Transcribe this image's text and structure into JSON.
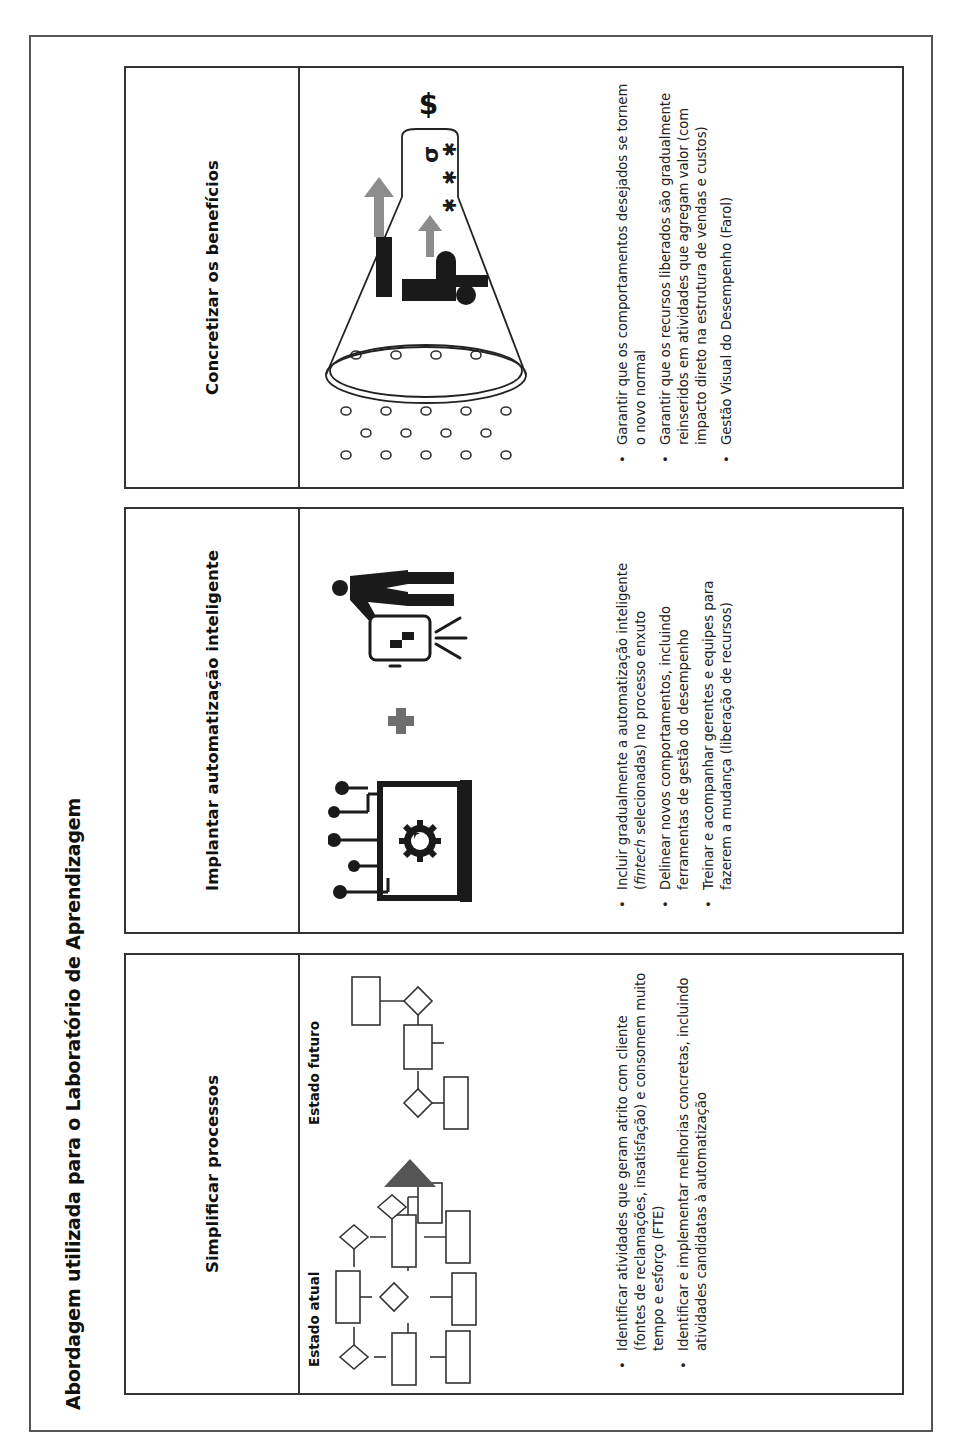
{
  "title": "Abordagem utilizada para o Laboratório de Aprendizagem",
  "panels": [
    {
      "heading": "Simplificar processos",
      "illustration": {
        "current_label": "Estado atual",
        "future_label": "Estado futuro",
        "icons": [
          "flowchart-current-icon",
          "arrow-right-triangle-icon",
          "flowchart-future-icon"
        ]
      },
      "bullets": [
        {
          "text": "Identificar atividades que geram atrito com cliente (fontes de reclamações, insatisfação) e consomem muito tempo e esforço (FTE)"
        },
        {
          "text": "Identificar e implementar melhorias concretas, incluindo atividades candidatas à automatização"
        }
      ]
    },
    {
      "heading": "Implantar automatização inteligente",
      "illustration": {
        "icons": [
          "automation-gear-monitor-icon",
          "plus-icon",
          "presenter-board-icon"
        ]
      },
      "bullets": [
        {
          "pre": "Incluir gradualmente a automatização inteligente (",
          "em": "fintech",
          "post": " selecionadas) no processo enxuto"
        },
        {
          "text": "Delinear novos comportamentos, incluindo ferramentas de gestão do desempenho"
        },
        {
          "text": "Treinar e acompanhar gerentes e equipes para fazerem a mudança (liberação de recursos)"
        }
      ]
    },
    {
      "heading": "Concretizar os benefícios",
      "illustration": {
        "icons": [
          "funnel-benefits-icon",
          "dollar-icon",
          "people-icon",
          "growth-arrow-icon"
        ],
        "currency_symbol": "$"
      },
      "bullets": [
        {
          "text": "Garantir que os comportamentos desejados se tornem o novo normal"
        },
        {
          "text": "Garantir que os recursos liberados são gradualmente reinseridos em atividades que agregam valor (com impacto direto na estrutura de vendas e custos)"
        },
        {
          "text": "Gestão Visual do Desempenho (Farol)"
        }
      ]
    }
  ],
  "bullet_glyph": "•",
  "colors": {
    "border": "#333333",
    "accent_gray": "#8c8c8c",
    "icon_dark": "#1a1a1a",
    "arrow_triangle": "#555555"
  }
}
